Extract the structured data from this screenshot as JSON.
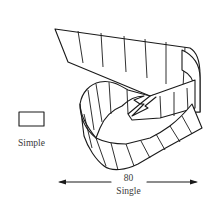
{
  "figure": {
    "simple": {
      "label": "Simple",
      "shape": "rectangle"
    },
    "single": {
      "value": "80",
      "label": "Single",
      "shape": "twisted-ribbon",
      "arrow": "double-headed-horizontal"
    },
    "colors": {
      "stroke": "#1a1a1a",
      "text": "#3a3a3a",
      "background": "#ffffff"
    }
  }
}
